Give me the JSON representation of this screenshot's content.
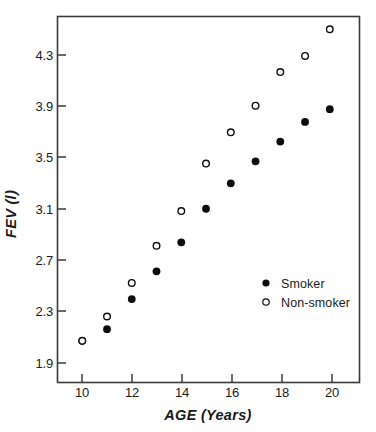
{
  "chart_data": {
    "type": "scatter",
    "title": "",
    "xlabel": "AGE (Years)",
    "ylabel": "FEV (l)",
    "x": [
      10,
      11,
      12,
      13,
      14,
      15,
      16,
      17,
      18,
      19,
      20
    ],
    "xlim": [
      9.0,
      21.2
    ],
    "ylim": [
      1.54,
      4.7
    ],
    "grid": false,
    "legend_position": "center-right",
    "xticks": [
      "10",
      "12",
      "14",
      "16",
      "18",
      "20"
    ],
    "xtick_values": [
      10,
      12,
      14,
      16,
      18,
      20
    ],
    "yticks": [
      "1.9",
      "2.3",
      "2.7",
      "3.1",
      "3.5",
      "3.9",
      "4.3"
    ],
    "ytick_values": [
      1.9,
      2.3,
      2.7,
      3.1,
      3.5,
      3.9,
      4.3
    ],
    "series": [
      {
        "name": "Smoker",
        "marker": "filled-circle",
        "color": "#0d0d0d",
        "values": [
          1.9,
          2.0,
          2.26,
          2.5,
          2.75,
          3.04,
          3.26,
          3.45,
          3.62,
          3.79,
          3.9
        ]
      },
      {
        "name": "Non-smoker",
        "marker": "open-circle",
        "color": "#0d0d0d",
        "values": [
          1.9,
          2.11,
          2.4,
          2.72,
          3.02,
          3.43,
          3.7,
          3.93,
          4.22,
          4.36,
          4.59
        ]
      }
    ]
  },
  "legend": {
    "entries": [
      {
        "label": "Smoker",
        "marker": "filled-circle"
      },
      {
        "label": "Non-smoker",
        "marker": "open-circle"
      }
    ]
  },
  "axes": {
    "x_title": "AGE (Years)",
    "y_title": "FEV (l)"
  }
}
